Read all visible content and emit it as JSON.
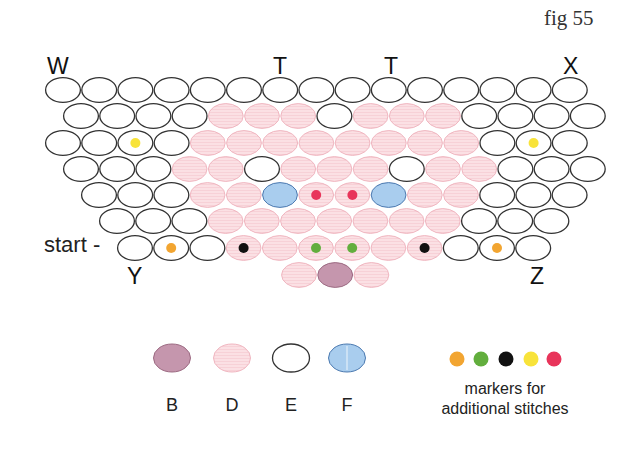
{
  "figure": {
    "title": "fig 55",
    "labels": {
      "W": "W",
      "T1": "T",
      "T2": "T",
      "X": "X",
      "Y": "Y",
      "Z": "Z",
      "start": "start -"
    }
  },
  "colors": {
    "B": {
      "fill": "#c596ad",
      "stroke": "#9c6a82"
    },
    "D": {
      "fill": "#fbe0e4",
      "stroke": "#f0b6c0"
    },
    "E": {
      "fill": "#ffffff",
      "stroke": "#333333"
    },
    "F": {
      "fill": "#a9cdee",
      "stroke": "#4b79b0"
    },
    "markers": {
      "orange": "#f2a531",
      "green": "#62ae3d",
      "black": "#111111",
      "yellow": "#f8e33a",
      "red": "#e8345a"
    }
  },
  "grid": {
    "pitch": 36.2,
    "ellipse_width": 36,
    "ellipse_height": 26,
    "rows": [
      {
        "x": 45,
        "y": 77,
        "cells": [
          "E",
          "E",
          "E",
          "E",
          "E",
          "E",
          "E",
          "E",
          "E",
          "E",
          "E",
          "E",
          "E",
          "E",
          "E"
        ],
        "markers": {}
      },
      {
        "x": 63,
        "y": 103,
        "cells": [
          "E",
          "E",
          "E",
          "E",
          "D",
          "D",
          "D",
          "E",
          "D",
          "D",
          "D",
          "E",
          "E",
          "E",
          "E"
        ],
        "markers": {}
      },
      {
        "x": 45,
        "y": 130,
        "cells": [
          "E",
          "E",
          "E",
          "E",
          "D",
          "D",
          "D",
          "D",
          "D",
          "D",
          "D",
          "D",
          "E",
          "E",
          "E"
        ],
        "markers": {
          "2": "yellow",
          "13": "yellow"
        }
      },
      {
        "x": 63,
        "y": 156,
        "cells": [
          "E",
          "E",
          "E",
          "D",
          "D",
          "E",
          "D",
          "D",
          "D",
          "E",
          "D",
          "D",
          "E",
          "E",
          "E"
        ],
        "markers": {}
      },
      {
        "x": 81,
        "y": 182,
        "cells": [
          "E",
          "E",
          "E",
          "D",
          "D",
          "F",
          "D",
          "D",
          "F",
          "D",
          "D",
          "E",
          "E",
          "E"
        ],
        "markers": {
          "6": "red",
          "7": "red"
        }
      },
      {
        "x": 99,
        "y": 208,
        "cells": [
          "E",
          "E",
          "E",
          "D",
          "D",
          "D",
          "D",
          "D",
          "D",
          "D",
          "E",
          "E",
          "E"
        ],
        "markers": {}
      },
      {
        "x": 117,
        "y": 235,
        "cells": [
          "E",
          "E",
          "E",
          "D",
          "D",
          "D",
          "D",
          "D",
          "D",
          "E",
          "E",
          "E"
        ],
        "markers": {
          "1": "orange",
          "3": "black",
          "5": "green",
          "6": "green",
          "8": "black",
          "10": "orange"
        }
      },
      {
        "x": 281,
        "y": 262,
        "cells": [
          "D",
          "B",
          "D"
        ],
        "markers": {}
      }
    ]
  },
  "legend": {
    "items": [
      {
        "key": "B",
        "label": "B",
        "cx": 172
      },
      {
        "key": "D",
        "label": "D",
        "cx": 232
      },
      {
        "key": "E",
        "label": "E",
        "cx": 291
      },
      {
        "key": "F",
        "label": "F",
        "cx": 347
      }
    ],
    "marker_dots": [
      "orange",
      "green",
      "black",
      "yellow",
      "red"
    ],
    "markers_caption_line1": "markers for",
    "markers_caption_line2": "additional stitches"
  }
}
